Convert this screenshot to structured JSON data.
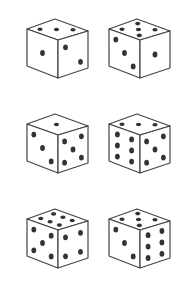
{
  "colors": {
    "outline": "#444444",
    "pip": "#333333",
    "face": "#ffffff",
    "background": "#ffffff"
  },
  "dice": [
    {
      "id": "die-1",
      "row": 1,
      "col": 1,
      "faces": {
        "top": 3,
        "left": 1,
        "right": 2
      }
    },
    {
      "id": "die-2",
      "row": 1,
      "col": 2,
      "faces": {
        "top": 5,
        "left": 3,
        "right": 1
      }
    },
    {
      "id": "die-3",
      "row": 2,
      "col": 1,
      "faces": {
        "top": 1,
        "left": 3,
        "right": 5
      }
    },
    {
      "id": "die-4",
      "row": 2,
      "col": 2,
      "faces": {
        "top": 3,
        "left": 6,
        "right": 5
      }
    },
    {
      "id": "die-5",
      "row": 3,
      "col": 1,
      "faces": {
        "top": 6,
        "left": 5,
        "right": 4
      }
    },
    {
      "id": "die-6",
      "row": 3,
      "col": 2,
      "faces": {
        "top": 5,
        "left": 3,
        "right": 6
      }
    }
  ]
}
